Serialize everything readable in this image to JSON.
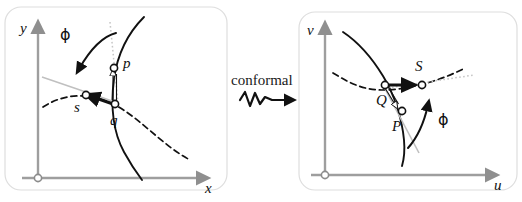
{
  "figure": {
    "title_text": "conformal",
    "background_color": "#ffffff",
    "panel_border_color": "#d8d8d8",
    "axis_color": "#a0a0a0",
    "curve_color": "#111111",
    "tangent_color": "#b5b5b5",
    "dotted_color": "#c2c2c2"
  },
  "left_panel": {
    "name": "source-plane",
    "axes": {
      "y_label": "y",
      "x_label": "x",
      "origin_marker": "open-circle"
    },
    "angle_label": "ϕ",
    "points": [
      {
        "id": "p",
        "label": "p",
        "marker": "open-circle"
      },
      {
        "id": "q",
        "label": "q",
        "marker": "open-circle"
      },
      {
        "id": "s",
        "label": "s",
        "marker": "open-circle"
      }
    ],
    "curves": [
      {
        "id": "solid-curve",
        "style": "solid"
      },
      {
        "id": "dashed-curve",
        "style": "dashed"
      },
      {
        "id": "tangent-line-1",
        "style": "solid-light"
      },
      {
        "id": "tangent-line-2",
        "style": "dotted-light"
      }
    ],
    "vectors": [
      {
        "id": "q-to-p",
        "style": "hollow-arrow"
      },
      {
        "id": "q-to-s",
        "style": "filled-arrow"
      }
    ]
  },
  "transform": {
    "label": "conformal",
    "arrow_style": "squiggly-arrow"
  },
  "right_panel": {
    "name": "image-plane",
    "axes": {
      "v_label": "ν",
      "u_label": "u",
      "origin_marker": "open-circle"
    },
    "angle_label": "ϕ",
    "points": [
      {
        "id": "P",
        "label": "P",
        "marker": "open-circle"
      },
      {
        "id": "Q",
        "label": "Q",
        "marker": "open-circle"
      },
      {
        "id": "S",
        "label": "S",
        "marker": "open-circle"
      }
    ],
    "curves": [
      {
        "id": "solid-curve",
        "style": "solid"
      },
      {
        "id": "dashed-curve",
        "style": "dashed"
      },
      {
        "id": "tangent-line-1",
        "style": "solid-light"
      },
      {
        "id": "tangent-line-2",
        "style": "dotted-light"
      }
    ],
    "vectors": [
      {
        "id": "Q-to-P",
        "style": "hollow-arrow"
      },
      {
        "id": "Q-to-S",
        "style": "filled-arrow"
      }
    ]
  }
}
